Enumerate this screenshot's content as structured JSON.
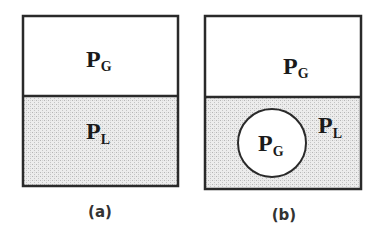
{
  "colors": {
    "stroke": "#2a2a2a",
    "gas_fill": "#ffffff",
    "liquid_fill": "#e6e6e6"
  },
  "panels": [
    {
      "id": "a",
      "caption": "(a)",
      "gas_label": {
        "main": "P",
        "sub": "G"
      },
      "liquid_label": {
        "main": "P",
        "sub": "L"
      }
    },
    {
      "id": "b",
      "caption": "(b)",
      "gas_label": {
        "main": "P",
        "sub": "G"
      },
      "bubble_label": {
        "main": "P",
        "sub": "G"
      },
      "liquid_label": {
        "main": "P",
        "sub": "L"
      }
    }
  ]
}
